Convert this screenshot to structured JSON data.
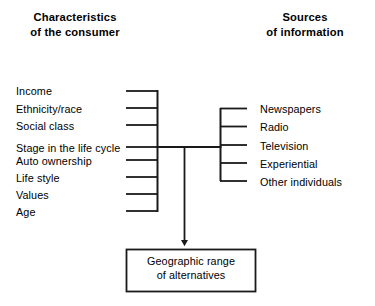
{
  "diagram": {
    "type": "bracket-flow-diagram",
    "colors": {
      "line": "#1a1a1a",
      "text": "#000000",
      "background": "#ffffff"
    },
    "left_group": {
      "heading": {
        "line1": "Characteristics",
        "line2": "of the consumer"
      },
      "items": [
        {
          "label": "Income"
        },
        {
          "label": "Ethnicity/race"
        },
        {
          "label": "Social class"
        },
        {
          "label": "Stage in the life cycle"
        },
        {
          "label": "Auto ownership"
        },
        {
          "label": "Life style"
        },
        {
          "label": "Values"
        },
        {
          "label": "Age"
        }
      ]
    },
    "right_group": {
      "heading": {
        "line1": "Sources",
        "line2": "of information"
      },
      "items": [
        {
          "label": "Newspapers"
        },
        {
          "label": "Radio"
        },
        {
          "label": "Television"
        },
        {
          "label": "Experiential"
        },
        {
          "label": "Other individuals"
        }
      ]
    },
    "outcome_box": {
      "line1": "Geographic range",
      "line2": "of alternatives"
    }
  }
}
